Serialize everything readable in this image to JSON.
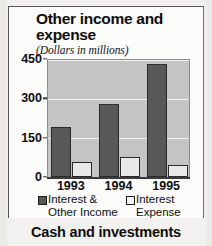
{
  "figure": {
    "title": "Other income and expense",
    "subtitle": "(Dollars in millions)",
    "bottom_caption": "Cash and investments"
  },
  "colors": {
    "series_dark": "#585858",
    "series_light": "#e9e9e9",
    "plot_background": "#c4c4c4",
    "gridline": "#f4f4f4",
    "axis": "#3a3a3a",
    "page_background": "#f2f1ef"
  },
  "chart_data": {
    "type": "bar",
    "title": "Other income and expense",
    "subtitle": "(Dollars in millions)",
    "xlabel": "",
    "ylabel": "",
    "categories": [
      "1993",
      "1994",
      "1995"
    ],
    "series": [
      {
        "name": "Interest & Other Income",
        "name_line1": "Interest &",
        "name_line2": "Other Income",
        "color": "#585858",
        "values": [
          190,
          280,
          430
        ]
      },
      {
        "name": "Interest Expense",
        "name_line1": "Interest",
        "name_line2": "Expense",
        "color": "#e9e9e9",
        "values": [
          58,
          77,
          47
        ]
      }
    ],
    "ylim": [
      0,
      450
    ],
    "yticks": [
      0,
      150,
      300,
      450
    ],
    "ytick_labels": [
      "0",
      "150",
      "300",
      "450"
    ],
    "grid": true,
    "legend_position": "bottom"
  }
}
